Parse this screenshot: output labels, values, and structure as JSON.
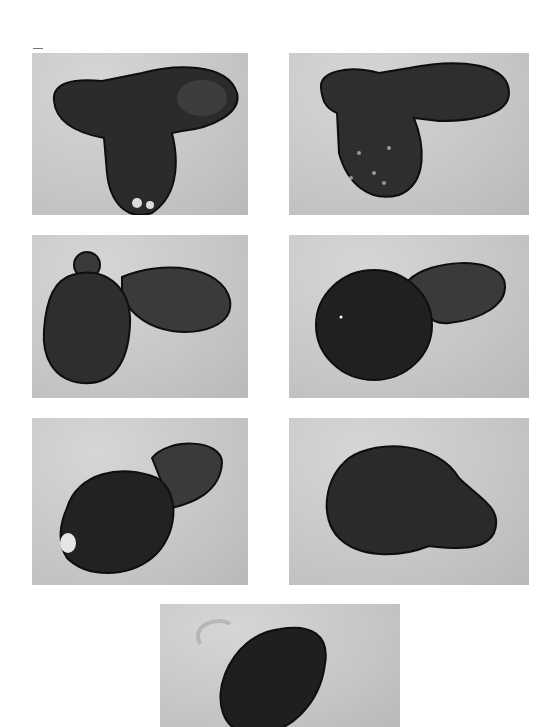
{
  "figure": {
    "layout": "3 rows x 2 columns plus one centered panel below",
    "panels": [
      {
        "id": 1,
        "position": "row1-left",
        "stage": "T-shaped organism, elongated upper bud extending right"
      },
      {
        "id": 2,
        "position": "row1-right",
        "stage": "T-shaped organism, bud extending right from top"
      },
      {
        "id": 3,
        "position": "row2-left",
        "stage": "oval body with small knob at top and oval bud to the right"
      },
      {
        "id": 4,
        "position": "row2-right",
        "stage": "dark rounded body joined to oval bud upper right"
      },
      {
        "id": 5,
        "position": "row3-left",
        "stage": "dark body with bud at upper right, constriction narrowing"
      },
      {
        "id": 6,
        "position": "row3-right",
        "stage": "rounded body with small lobe at lower right"
      },
      {
        "id": 7,
        "position": "row4-center",
        "stage": "single dark oval organism, partially cropped at bottom"
      }
    ],
    "colors": {
      "background": "#ffffff",
      "field": "#c8c8c8",
      "organism": "#2a2a2a",
      "membrane": "#111111"
    }
  }
}
